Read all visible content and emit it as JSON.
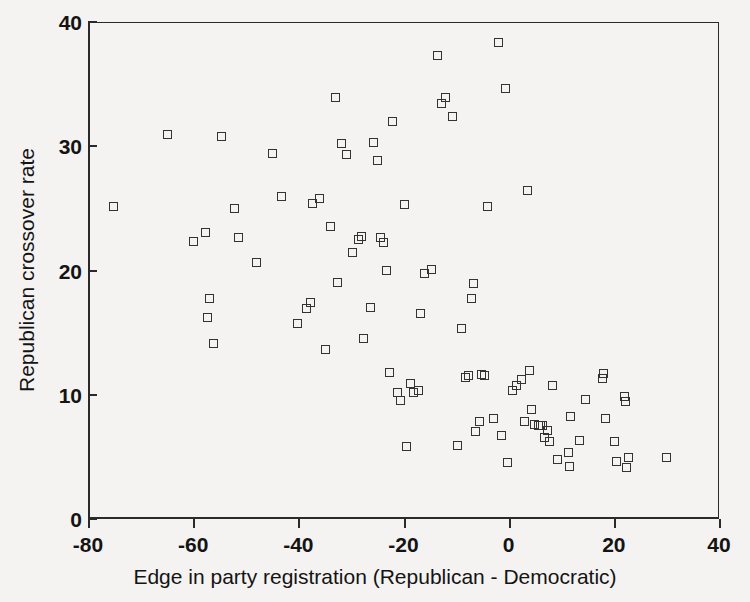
{
  "chart_data": {
    "type": "scatter",
    "title": "",
    "xlabel": "Edge in party registration (Republican - Democratic)",
    "ylabel": "Republican crossover rate",
    "xlim": [
      -80,
      40
    ],
    "ylim": [
      0,
      40
    ],
    "xticks": [
      -80,
      -60,
      -40,
      -20,
      0,
      20,
      40
    ],
    "xticklabels": [
      "-80",
      "-60",
      "-40",
      "-20",
      "0",
      "20",
      "40"
    ],
    "yticks": [
      0,
      10,
      20,
      30,
      40
    ],
    "yticklabels": [
      "0",
      "10",
      "20",
      "30",
      "40"
    ],
    "grid": false,
    "legend": null,
    "marker": "open-square",
    "marker_color": "#333333",
    "background_color": "#f4f3f1",
    "series": [
      {
        "name": "counties",
        "points": [
          [
            -75.6,
            25.2
          ],
          [
            -65.2,
            31.0
          ],
          [
            -60.3,
            22.4
          ],
          [
            -58.0,
            23.1
          ],
          [
            -57.2,
            17.8
          ],
          [
            -57.6,
            16.3
          ],
          [
            -56.6,
            14.2
          ],
          [
            -55.0,
            30.9
          ],
          [
            -52.5,
            25.1
          ],
          [
            -51.8,
            22.7
          ],
          [
            -48.3,
            20.7
          ],
          [
            -45.3,
            29.5
          ],
          [
            -43.5,
            26.0
          ],
          [
            -40.6,
            15.8
          ],
          [
            -38.8,
            17.0
          ],
          [
            -38.0,
            17.5
          ],
          [
            -37.6,
            25.5
          ],
          [
            -36.4,
            25.9
          ],
          [
            -35.2,
            13.7
          ],
          [
            -34.3,
            23.6
          ],
          [
            -33.4,
            34.0
          ],
          [
            -33.0,
            19.1
          ],
          [
            -32.2,
            30.3
          ],
          [
            -31.2,
            29.4
          ],
          [
            -30.0,
            21.5
          ],
          [
            -29.0,
            22.6
          ],
          [
            -28.3,
            22.8
          ],
          [
            -28.0,
            14.6
          ],
          [
            -26.6,
            17.1
          ],
          [
            -26.0,
            30.4
          ],
          [
            -25.4,
            28.9
          ],
          [
            -24.8,
            22.7
          ],
          [
            -24.2,
            22.3
          ],
          [
            -23.6,
            20.1
          ],
          [
            -23.1,
            11.9
          ],
          [
            -22.4,
            32.1
          ],
          [
            -21.5,
            10.3
          ],
          [
            -20.9,
            9.6
          ],
          [
            -20.2,
            25.4
          ],
          [
            -19.8,
            5.9
          ],
          [
            -19.0,
            11.0
          ],
          [
            -18.4,
            10.3
          ],
          [
            -17.6,
            10.4
          ],
          [
            -17.2,
            16.6
          ],
          [
            -16.4,
            19.8
          ],
          [
            -15.1,
            20.2
          ],
          [
            -14.0,
            37.4
          ],
          [
            -13.2,
            33.5
          ],
          [
            -12.4,
            34.0
          ],
          [
            -11.0,
            32.5
          ],
          [
            -10.2,
            6.0
          ],
          [
            -9.4,
            15.4
          ],
          [
            -8.6,
            11.5
          ],
          [
            -8.0,
            11.6
          ],
          [
            -7.4,
            17.8
          ],
          [
            -7.0,
            19.0
          ],
          [
            -6.6,
            7.1
          ],
          [
            -6.0,
            7.9
          ],
          [
            -5.6,
            11.7
          ],
          [
            -5.0,
            11.6
          ],
          [
            -4.4,
            25.2
          ],
          [
            -3.2,
            8.2
          ],
          [
            -2.4,
            38.4
          ],
          [
            -1.8,
            6.8
          ],
          [
            -1.0,
            34.7
          ],
          [
            -0.6,
            4.6
          ],
          [
            0.4,
            10.4
          ],
          [
            1.2,
            10.8
          ],
          [
            2.0,
            11.3
          ],
          [
            2.6,
            7.9
          ],
          [
            3.2,
            26.5
          ],
          [
            3.6,
            12.0
          ],
          [
            4.0,
            8.9
          ],
          [
            4.6,
            7.7
          ],
          [
            5.2,
            7.6
          ],
          [
            5.6,
            7.6
          ],
          [
            6.0,
            7.6
          ],
          [
            6.4,
            6.6
          ],
          [
            7.0,
            7.2
          ],
          [
            7.4,
            6.3
          ],
          [
            8.0,
            10.8
          ],
          [
            9.0,
            4.9
          ],
          [
            11.0,
            5.4
          ],
          [
            11.2,
            4.3
          ],
          [
            11.4,
            8.3
          ],
          [
            13.0,
            6.4
          ],
          [
            14.2,
            9.7
          ],
          [
            17.4,
            11.4
          ],
          [
            17.6,
            11.8
          ],
          [
            18.0,
            8.2
          ],
          [
            19.8,
            6.3
          ],
          [
            20.2,
            4.7
          ],
          [
            21.6,
            9.9
          ],
          [
            21.8,
            9.5
          ],
          [
            22.0,
            4.2
          ],
          [
            22.4,
            5.0
          ],
          [
            29.6,
            5.0
          ]
        ]
      }
    ]
  },
  "axes": {
    "xlabel": "Edge in party registration (Republican - Democratic)",
    "ylabel": "Republican crossover rate"
  }
}
